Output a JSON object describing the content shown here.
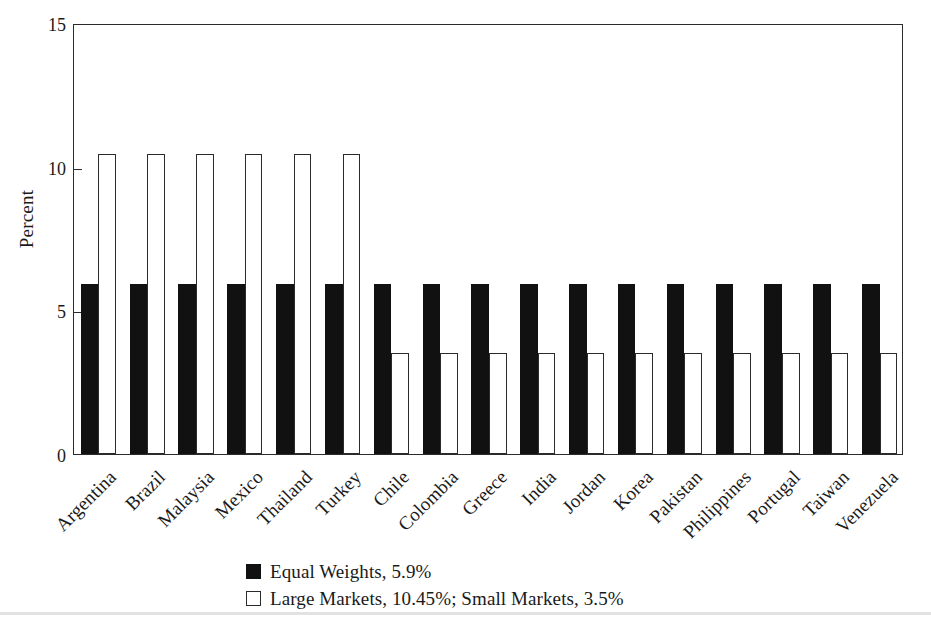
{
  "chart_data": {
    "type": "bar",
    "title": "",
    "xlabel": "",
    "ylabel": "Percent",
    "ylim": [
      0,
      15
    ],
    "yticks": [
      0,
      5,
      10,
      15
    ],
    "grid": false,
    "legend_position": "bottom",
    "categories": [
      "Argentina",
      "Brazil",
      "Malaysia",
      "Mexico",
      "Thailand",
      "Turkey",
      "Chile",
      "Colombia",
      "Greece",
      "India",
      "Jordan",
      "Korea",
      "Pakistan",
      "Philippines",
      "Portugal",
      "Taiwan",
      "Venezuela"
    ],
    "series": [
      {
        "name": "Equal Weights, 5.9%",
        "style": "filled-black",
        "values": [
          5.9,
          5.9,
          5.9,
          5.9,
          5.9,
          5.9,
          5.9,
          5.9,
          5.9,
          5.9,
          5.9,
          5.9,
          5.9,
          5.9,
          5.9,
          5.9,
          5.9
        ]
      },
      {
        "name": "Large Markets, 10.45%; Small Markets, 3.5%",
        "style": "open-white",
        "values": [
          10.45,
          10.45,
          10.45,
          10.45,
          10.45,
          10.45,
          3.5,
          3.5,
          3.5,
          3.5,
          3.5,
          3.5,
          3.5,
          3.5,
          3.5,
          3.5,
          3.5
        ]
      }
    ],
    "annotations": {
      "large_markets": [
        "Argentina",
        "Brazil",
        "Malaysia",
        "Mexico",
        "Thailand",
        "Turkey"
      ],
      "small_markets": [
        "Chile",
        "Colombia",
        "Greece",
        "India",
        "Jordan",
        "Korea",
        "Pakistan",
        "Philippines",
        "Portugal",
        "Taiwan",
        "Venezuela"
      ]
    }
  },
  "axis": {
    "y_title": "Percent",
    "y_tick_labels": [
      "0",
      "5",
      "10",
      "15"
    ]
  },
  "legend": {
    "items": [
      {
        "label": "Equal Weights, 5.9%",
        "swatch": "filled-square-black"
      },
      {
        "label": "Large Markets, 10.45%; Small Markets, 3.5%",
        "swatch": "open-square-white"
      }
    ]
  },
  "colors": {
    "bar_filled": "#111111",
    "bar_open_fill": "#ffffff",
    "bar_open_stroke": "#2b2b2b",
    "axis": "#2b2b2b",
    "text": "#1a1a1a",
    "background": "#ffffff"
  }
}
